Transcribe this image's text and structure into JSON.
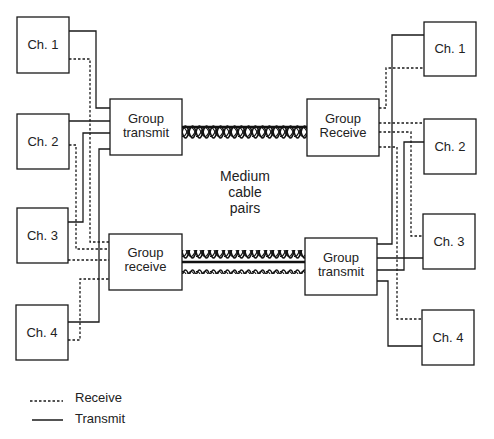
{
  "diagram": {
    "left": {
      "channels": [
        {
          "label": "Ch. 1"
        },
        {
          "label": "Ch. 2"
        },
        {
          "label": "Ch. 3"
        },
        {
          "label": "Ch. 4"
        }
      ],
      "group_transmit": {
        "line1": "Group",
        "line2": "transmit"
      },
      "group_receive": {
        "line1": "Group",
        "line2": "receive"
      }
    },
    "right": {
      "channels": [
        {
          "label": "Ch. 1"
        },
        {
          "label": "Ch. 2"
        },
        {
          "label": "Ch. 3"
        },
        {
          "label": "Ch. 4"
        }
      ],
      "group_receive": {
        "line1": "Group",
        "line2": "Receive"
      },
      "group_transmit": {
        "line1": "Group",
        "line2": "transmit"
      }
    },
    "medium": {
      "line1": "Medium",
      "line2": "cable",
      "line3": "pairs"
    },
    "legend": [
      {
        "style": "dashed",
        "label": "Receive"
      },
      {
        "style": "solid",
        "label": "Transmit"
      }
    ],
    "colors": {
      "line": "#1a1a1a",
      "background": "#ffffff"
    }
  }
}
